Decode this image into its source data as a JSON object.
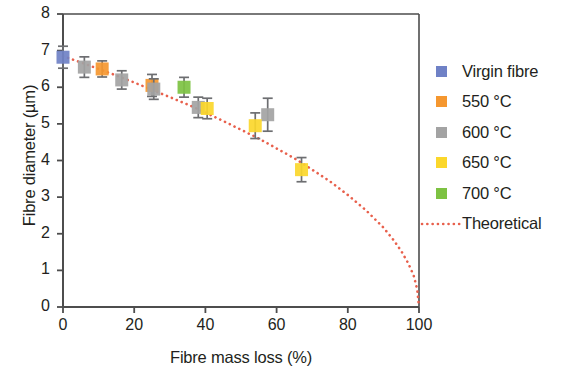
{
  "chart_data": {
    "type": "scatter",
    "title": "",
    "xlabel": "Fibre mass loss (%)",
    "ylabel": "Fibre diameter (µm)",
    "xlim": [
      0,
      100
    ],
    "ylim": [
      0,
      8
    ],
    "xticks": [
      0,
      20,
      40,
      60,
      80,
      100
    ],
    "yticks": [
      0,
      1,
      2,
      3,
      4,
      5,
      6,
      7,
      8
    ],
    "grid": false,
    "legend_position": "right",
    "error_bars": "vertical",
    "series": [
      {
        "name": "Virgin fibre",
        "color": "#6f81c6",
        "points": [
          {
            "x": 0.0,
            "y": 6.82,
            "yerr": 0.3
          }
        ]
      },
      {
        "name": "550 °C",
        "color": "#f5972f",
        "points": [
          {
            "x": 11.0,
            "y": 6.5,
            "yerr": 0.22
          },
          {
            "x": 25.0,
            "y": 6.05,
            "yerr": 0.3
          }
        ]
      },
      {
        "name": "600 °C",
        "color": "#a3a3a3",
        "points": [
          {
            "x": 6.0,
            "y": 6.55,
            "yerr": 0.28
          },
          {
            "x": 16.5,
            "y": 6.2,
            "yerr": 0.25
          },
          {
            "x": 25.5,
            "y": 5.95,
            "yerr": 0.28
          },
          {
            "x": 38.0,
            "y": 5.45,
            "yerr": 0.28
          },
          {
            "x": 57.5,
            "y": 5.25,
            "yerr": 0.45
          }
        ]
      },
      {
        "name": "650 °C",
        "color": "#fbd72b",
        "points": [
          {
            "x": 40.5,
            "y": 5.42,
            "yerr": 0.28
          },
          {
            "x": 54.0,
            "y": 4.95,
            "yerr": 0.35
          },
          {
            "x": 67.0,
            "y": 3.75,
            "yerr": 0.33
          }
        ]
      },
      {
        "name": "700 °C",
        "color": "#7dc242",
        "points": [
          {
            "x": 34.0,
            "y": 6.0,
            "yerr": 0.27
          }
        ]
      },
      {
        "name": "Theoretical",
        "color": "#e8604c",
        "style": "dotted-line",
        "curve": [
          {
            "x": 0,
            "y": 6.85
          },
          {
            "x": 5,
            "y": 6.68
          },
          {
            "x": 10,
            "y": 6.5
          },
          {
            "x": 15,
            "y": 6.32
          },
          {
            "x": 20,
            "y": 6.13
          },
          {
            "x": 25,
            "y": 5.93
          },
          {
            "x": 30,
            "y": 5.73
          },
          {
            "x": 35,
            "y": 5.53
          },
          {
            "x": 40,
            "y": 5.31
          },
          {
            "x": 45,
            "y": 5.08
          },
          {
            "x": 50,
            "y": 4.84
          },
          {
            "x": 55,
            "y": 4.6
          },
          {
            "x": 60,
            "y": 4.33
          },
          {
            "x": 65,
            "y": 4.06
          },
          {
            "x": 70,
            "y": 3.75
          },
          {
            "x": 75,
            "y": 3.43
          },
          {
            "x": 80,
            "y": 3.06
          },
          {
            "x": 85,
            "y": 2.65
          },
          {
            "x": 90,
            "y": 2.17
          },
          {
            "x": 93,
            "y": 1.81
          },
          {
            "x": 95,
            "y": 1.53
          },
          {
            "x": 97,
            "y": 1.19
          },
          {
            "x": 98.5,
            "y": 0.86
          },
          {
            "x": 99.5,
            "y": 0.48
          },
          {
            "x": 100,
            "y": 0.0
          }
        ]
      }
    ]
  },
  "legend": {
    "items": [
      {
        "label": "Virgin fibre",
        "color": "#6f81c6",
        "marker": "square"
      },
      {
        "label": "550 °C",
        "color": "#f5972f",
        "marker": "square"
      },
      {
        "label": "600 °C",
        "color": "#a3a3a3",
        "marker": "square"
      },
      {
        "label": "650 °C",
        "color": "#fbd72b",
        "marker": "square"
      },
      {
        "label": "700 °C",
        "color": "#7dc242",
        "marker": "square"
      },
      {
        "label": "Theoretical",
        "color": "#e8604c",
        "marker": "dotted-line"
      }
    ]
  },
  "axes": {
    "x_title": "Fibre mass loss (%)",
    "y_title": "Fibre diameter (µm)",
    "x_tick_labels": [
      "0",
      "20",
      "40",
      "60",
      "80",
      "100"
    ],
    "y_tick_labels": [
      "0",
      "1",
      "2",
      "3",
      "4",
      "5",
      "6",
      "7",
      "8"
    ]
  },
  "colors": {
    "axis": "#4d4d4d",
    "text": "#231f20",
    "theoretical": "#e8604c",
    "errorbar": "#6d6e71"
  }
}
